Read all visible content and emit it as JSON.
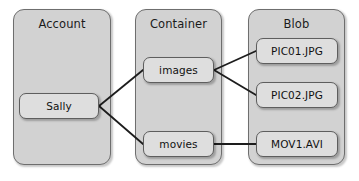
{
  "diagram": {
    "canvas": {
      "width": 359,
      "height": 181,
      "background": "#ffffff"
    },
    "style": {
      "group_fill": "#d2d2d2",
      "group_stroke": "#6e6e6e",
      "node_fill": "#dedede",
      "node_stroke": "#5e5e5e",
      "connector_color": "#1d1d1d",
      "text_color": "#111111"
    },
    "groups": [
      {
        "id": "account",
        "label": "Account",
        "x": 13,
        "y": 9,
        "w": 98,
        "h": 156
      },
      {
        "id": "container",
        "label": "Container",
        "x": 135,
        "y": 9,
        "w": 87,
        "h": 156
      },
      {
        "id": "blob",
        "label": "Blob",
        "x": 248,
        "y": 9,
        "w": 97,
        "h": 156
      }
    ],
    "nodes": [
      {
        "id": "sally",
        "label": "Sally",
        "group": "account",
        "x": 19,
        "y": 93,
        "w": 80,
        "h": 26
      },
      {
        "id": "images",
        "label": "images",
        "group": "container",
        "x": 143,
        "y": 57,
        "w": 71,
        "h": 26
      },
      {
        "id": "movies",
        "label": "movies",
        "group": "container",
        "x": 143,
        "y": 131,
        "w": 71,
        "h": 26
      },
      {
        "id": "pic01",
        "label": "PIC01.JPG",
        "group": "blob",
        "x": 256,
        "y": 38,
        "w": 82,
        "h": 26
      },
      {
        "id": "pic02",
        "label": "PIC02.JPG",
        "group": "blob",
        "x": 256,
        "y": 82,
        "w": 82,
        "h": 26
      },
      {
        "id": "mov1",
        "label": "MOV1.AVI",
        "group": "blob",
        "x": 256,
        "y": 131,
        "w": 82,
        "h": 26
      }
    ],
    "connectors": [
      {
        "id": "sally-images",
        "from": "sally",
        "to": "images",
        "x1": 99,
        "y1": 106,
        "x2": 143,
        "y2": 70
      },
      {
        "id": "sally-movies",
        "from": "sally",
        "to": "movies",
        "x1": 99,
        "y1": 106,
        "x2": 143,
        "y2": 144
      },
      {
        "id": "images-pic01",
        "from": "images",
        "to": "pic01",
        "x1": 214,
        "y1": 70,
        "x2": 256,
        "y2": 51
      },
      {
        "id": "images-pic02",
        "from": "images",
        "to": "pic02",
        "x1": 214,
        "y1": 70,
        "x2": 256,
        "y2": 95
      },
      {
        "id": "movies-mov1",
        "from": "movies",
        "to": "mov1",
        "x1": 214,
        "y1": 144,
        "x2": 256,
        "y2": 144
      }
    ]
  }
}
